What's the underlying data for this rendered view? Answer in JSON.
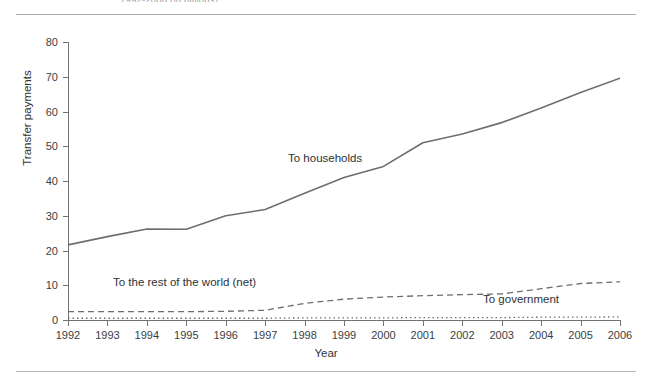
{
  "header": {
    "top_caption": "1992-2006 (in billions)"
  },
  "axes": {
    "y_label": "Transfer payments",
    "x_label": "Year",
    "y_ticks": [
      0,
      10,
      20,
      30,
      40,
      50,
      60,
      70,
      80
    ],
    "x_ticks": [
      "1992",
      "1993",
      "1994",
      "1995",
      "1996",
      "1997",
      "1998",
      "1999",
      "2000",
      "2001",
      "2002",
      "2003",
      "2004",
      "2005",
      "2006"
    ]
  },
  "annotations": {
    "households": "To households",
    "rest_of_world": "To the rest of the world (net)",
    "government": "To government"
  },
  "colors": {
    "line": "#6b6e72",
    "axis": "#6f7276",
    "text": "#303437",
    "rule": "#a9adb1",
    "background": "#ffffff"
  },
  "chart_data": {
    "type": "line",
    "title": "",
    "xlabel": "Year",
    "ylabel": "Transfer payments",
    "xlim": [
      1992,
      2006
    ],
    "ylim": [
      0,
      80
    ],
    "grid": false,
    "legend_position": "inline-annotations",
    "x": [
      1992,
      1993,
      1994,
      1995,
      1996,
      1997,
      1998,
      1999,
      2000,
      2001,
      2002,
      2003,
      2004,
      2005,
      2006
    ],
    "series": [
      {
        "name": "To households",
        "style": "solid",
        "values": [
          21.6,
          24.0,
          26.2,
          26.1,
          30.0,
          31.8,
          36.5,
          41.0,
          44.2,
          51.0,
          53.5,
          56.8,
          61.0,
          65.5,
          69.6
        ]
      },
      {
        "name": "To the rest of the world (net)",
        "style": "dashed",
        "values": [
          2.4,
          2.4,
          2.4,
          2.4,
          2.5,
          2.8,
          4.8,
          6.0,
          6.6,
          7.0,
          7.3,
          7.5,
          9.0,
          10.5,
          11.0
        ]
      },
      {
        "name": "To government",
        "style": "dotted",
        "values": [
          0.5,
          0.5,
          0.5,
          0.5,
          0.5,
          0.5,
          0.6,
          0.6,
          0.6,
          0.7,
          0.7,
          0.7,
          0.8,
          0.8,
          0.9
        ]
      }
    ]
  }
}
